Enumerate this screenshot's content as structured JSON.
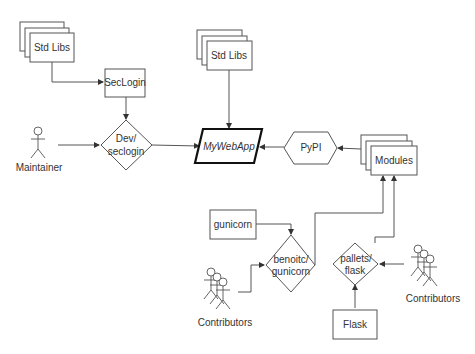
{
  "diagram": {
    "title": "",
    "nodes": {
      "std_libs_left": {
        "label": "Std Libs",
        "shape": "stacked-rectangle"
      },
      "seclogin": {
        "label": "SecLogin",
        "shape": "rectangle"
      },
      "dev_seclogin": {
        "label_line1": "Dev/",
        "label_line2": "seclogin",
        "shape": "diamond"
      },
      "maintainer": {
        "label": "Maintainer",
        "shape": "actor"
      },
      "std_libs_center": {
        "label": "Std Libs",
        "shape": "stacked-rectangle"
      },
      "mywebapp": {
        "label": "MyWebApp",
        "shape": "parallelogram"
      },
      "pypi": {
        "label": "PyPI",
        "shape": "hexagon"
      },
      "modules": {
        "label": "Modules",
        "shape": "stacked-rectangle"
      },
      "gunicorn": {
        "label": "gunicorn",
        "shape": "rectangle"
      },
      "benoitc_gunicorn": {
        "label_line1": "benoitc/",
        "label_line2": "gunicorn",
        "shape": "diamond"
      },
      "pallets_flask": {
        "label_line1": "pallets/",
        "label_line2": "flask",
        "shape": "diamond"
      },
      "flask": {
        "label": "Flask",
        "shape": "rectangle"
      },
      "contributors_left": {
        "label": "Contributors",
        "shape": "actor-group"
      },
      "contributors_right": {
        "label": "Contributors",
        "shape": "actor-group"
      }
    },
    "edges": [
      {
        "from": "Std Libs (left)",
        "to": "SecLogin"
      },
      {
        "from": "SecLogin",
        "to": "Dev/seclogin"
      },
      {
        "from": "Maintainer",
        "to": "Dev/seclogin"
      },
      {
        "from": "Dev/seclogin",
        "to": "MyWebApp"
      },
      {
        "from": "Std Libs (center)",
        "to": "MyWebApp"
      },
      {
        "from": "PyPI",
        "to": "MyWebApp"
      },
      {
        "from": "Modules",
        "to": "PyPI"
      },
      {
        "from": "gunicorn",
        "to": "benoitc/gunicorn"
      },
      {
        "from": "Contributors (left)",
        "to": "benoitc/gunicorn"
      },
      {
        "from": "benoitc/gunicorn",
        "to": "Modules"
      },
      {
        "from": "pallets/flask",
        "to": "Modules"
      },
      {
        "from": "Flask",
        "to": "pallets/flask"
      },
      {
        "from": "Contributors (right)",
        "to": "pallets/flask"
      }
    ],
    "colors": {
      "stroke": "#555555",
      "emphasis_stroke": "#111111",
      "text": "#333333",
      "background": "#ffffff"
    }
  }
}
